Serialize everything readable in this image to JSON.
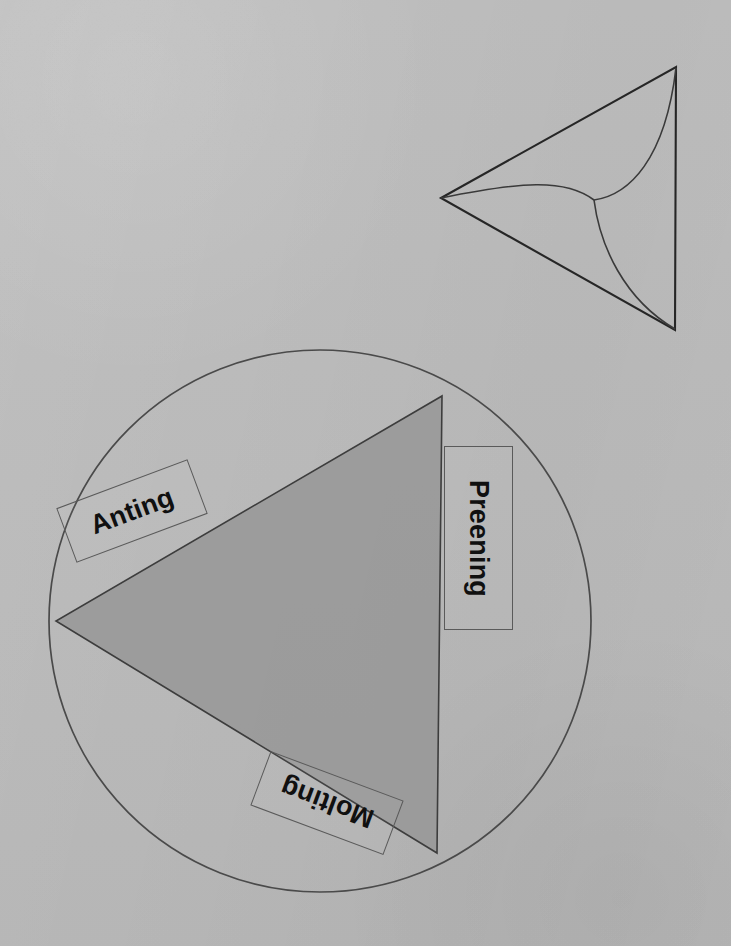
{
  "canvas": {
    "width": 731,
    "height": 946,
    "background_color": "#bcbcbc",
    "ink_color": "#2b2b2b",
    "triangle_fill_color": "#9a9a9a"
  },
  "figures": [
    {
      "id": "top-figure",
      "name": "deltoid-triangle-outline",
      "description": "Unfilled triangle with three internal curved arcs meeting at a central node",
      "triangle_vertices": [
        [
          441,
          198
        ],
        [
          676,
          67
        ],
        [
          675,
          330
        ]
      ],
      "arc_center": [
        594,
        200
      ],
      "filled": false
    },
    {
      "id": "bottom-figure",
      "name": "circle-with-filled-triangle",
      "description": "Large circle containing a shaded triangle, with three rotated text labels",
      "circle": {
        "cx": 320,
        "cy": 621,
        "r": 271
      },
      "triangle_vertices": [
        [
          442,
          396
        ],
        [
          437,
          853
        ],
        [
          56,
          621
        ]
      ],
      "filled": true
    }
  ],
  "labels": [
    {
      "id": "anting",
      "text": "Anting",
      "rotation_deg": -20.5,
      "box": {
        "x": 62,
        "y": 482,
        "width": 140,
        "height": 58
      }
    },
    {
      "id": "preening",
      "text": "Preening",
      "rotation_deg": 90,
      "box": {
        "x": 444,
        "y": 446,
        "width": 69,
        "height": 184
      }
    },
    {
      "id": "molting",
      "text": "Molting",
      "rotation_deg": 200.5,
      "box": {
        "x": 256,
        "y": 774,
        "width": 142,
        "height": 58
      }
    }
  ]
}
